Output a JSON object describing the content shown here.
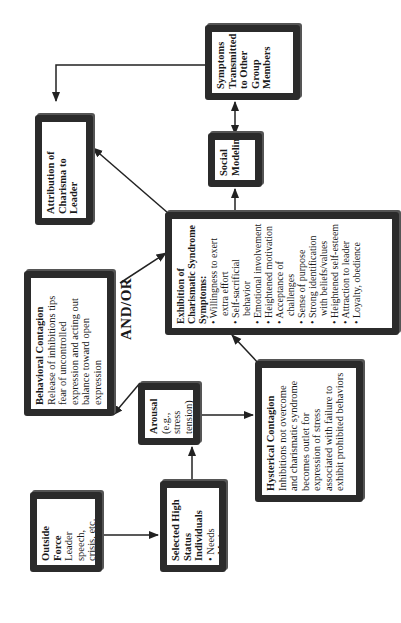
{
  "diagram": {
    "orientation": "rotated-90-ccw",
    "connector_label": "AND/OR",
    "nodes": {
      "outside_force": {
        "title": "Outside Force",
        "lines": [
          "Leader speech,",
          "crisis, etc."
        ]
      },
      "selected_individuals": {
        "title": "Selected High Status Individuals",
        "bullets": [
          "Needs",
          "Motives"
        ]
      },
      "arousal": {
        "title": "Arousal",
        "lines": [
          "(e.g., stress",
          "tension)"
        ]
      },
      "behavioral_contagion": {
        "title": "Behavioral Contagion",
        "lines": [
          "Release of inhibitions tips fear of uncontrolled expression and acting out balance toward open expression"
        ]
      },
      "hysterical_contagion": {
        "title": "Hysterical Contagion",
        "lines": [
          "Inhibitions not overcome and charismatic syndrome becomes outlet for expression of stress associated with failure to exhibit prohibited behaviors"
        ]
      },
      "charismatic_syndrome": {
        "title": "Exhibition of Charismatic Syndrome Symptoms:",
        "bullets": [
          "Willingness to exert extra effort",
          "Self-sacrificial behavior",
          "Emotional involvement",
          "Heightened motivation",
          "Acceptance of challenges",
          "Sense of purpose",
          "Strong identification with beliefs/values",
          "Heightened self-esteem",
          "Attraction to leader",
          "Loyalty, obedience"
        ]
      },
      "attribution": {
        "title": "Attribution of Charisma to Leader"
      },
      "social_modeling": {
        "title": "Social Modeling"
      },
      "symptoms_transmitted": {
        "title": "Symptoms Transmitted to Other Group Members"
      }
    },
    "edges": [
      {
        "from": "Outside Force",
        "to": "Selected High Status Individuals"
      },
      {
        "from": "Selected High Status Individuals",
        "to": "Arousal"
      },
      {
        "from": "Arousal",
        "to": "Behavioral Contagion"
      },
      {
        "from": "Arousal",
        "to": "Hysterical Contagion"
      },
      {
        "from": "Behavioral Contagion",
        "to": "Exhibition of Charismatic Syndrome"
      },
      {
        "from": "Hysterical Contagion",
        "to": "Exhibition of Charismatic Syndrome"
      },
      {
        "from": "Exhibition of Charismatic Syndrome",
        "to": "Attribution of Charisma to Leader"
      },
      {
        "from": "Exhibition of Charismatic Syndrome",
        "to": "Social Modeling"
      },
      {
        "from": "Social Modeling",
        "to": "Symptoms Transmitted to Other Group Members",
        "bidirectional": true
      },
      {
        "from": "Symptoms Transmitted to Other Group Members",
        "to": "Attribution of Charisma to Leader"
      }
    ],
    "colors": {
      "border": "#2b2b2b",
      "line": "#222222",
      "background": "#ffffff"
    }
  }
}
